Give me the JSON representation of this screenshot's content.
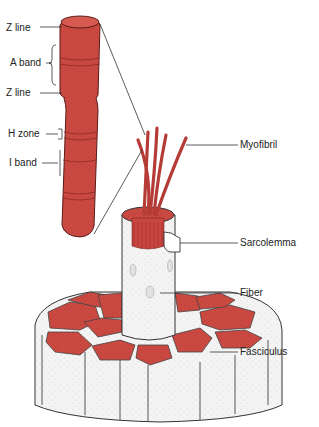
{
  "diagram": {
    "colors": {
      "muscle_red": "#c9463f",
      "muscle_dark": "#8e2a26",
      "tissue_fill": "#f2f2f2",
      "outline": "#333333"
    },
    "labels": {
      "z_line_top": "Z line",
      "a_band": "A band",
      "z_line_bottom": "Z line",
      "h_zone": "H zone",
      "i_band": "I band",
      "myofibril": "Myofibril",
      "sarcolemma": "Sarcolemma",
      "fiber": "Fiber",
      "fasciculus": "Fasciculus"
    }
  }
}
